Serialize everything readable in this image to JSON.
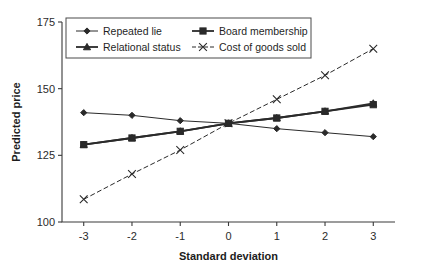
{
  "chart_data": {
    "type": "line",
    "title": "",
    "xlabel": "Standard deviation",
    "ylabel": "Predicted price",
    "x": [
      -3,
      -2,
      -1,
      0,
      1,
      2,
      3
    ],
    "xticklabels": [
      "-3",
      "-2",
      "-1",
      "0",
      "1",
      "2",
      "3"
    ],
    "yticklabels": [
      "100",
      "125",
      "150",
      "175"
    ],
    "yticks": [
      100,
      125,
      150,
      175
    ],
    "xlim": [
      -3.45,
      3.45
    ],
    "ylim": [
      100,
      175
    ],
    "grid": false,
    "legend_position": "top-inside",
    "series": [
      {
        "name": "Repeated lie",
        "marker": "diamond",
        "values": [
          141,
          140,
          138,
          137,
          135,
          133.5,
          132
        ]
      },
      {
        "name": "Board membership",
        "marker": "square",
        "values": [
          129,
          131.5,
          134,
          137,
          139,
          141.5,
          144
        ]
      },
      {
        "name": "Relational status",
        "marker": "triangle",
        "values": [
          129,
          131.5,
          134,
          137,
          139,
          141.5,
          144.5
        ]
      },
      {
        "name": "Cost of goods sold",
        "marker": "cross",
        "values": [
          108.5,
          118,
          127,
          137,
          146,
          155,
          165
        ]
      }
    ],
    "colors": {
      "line": "#2a2a2a",
      "axis": "#3a3a3a",
      "text": "#1c1c1c",
      "background": "#ffffff"
    }
  }
}
